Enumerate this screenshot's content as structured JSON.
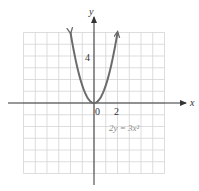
{
  "chart_data": {
    "type": "line",
    "title": "",
    "equation": "2y = 3x²",
    "function": "y = 1.5 * x^2",
    "xlabel": "x",
    "ylabel": "y",
    "xlim": [
      -6,
      6
    ],
    "ylim": [
      -6,
      6
    ],
    "grid": true,
    "grid_step": 1,
    "tick_labels": {
      "origin": "0",
      "x": [
        "2"
      ],
      "y": [
        "4"
      ]
    },
    "x_tick_values": [
      2
    ],
    "y_tick_values": [
      4
    ],
    "series": [
      {
        "name": "2y = 3x²",
        "x": [
          -2,
          -1.5,
          -1,
          -0.5,
          0,
          0.5,
          1,
          1.5,
          2
        ],
        "y": [
          6,
          3.375,
          1.5,
          0.375,
          0,
          0.375,
          1.5,
          3.375,
          6
        ],
        "color": "#6b6b6b",
        "arrows_at_ends": true
      }
    ],
    "colors": {
      "grid": "#d4d4d4",
      "axis": "#333333",
      "curve": "#6b6b6b",
      "equation_label": "#8a8a8a"
    }
  }
}
